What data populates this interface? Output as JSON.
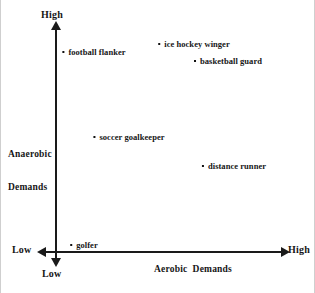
{
  "chart_data": {
    "type": "scatter",
    "title": "",
    "xlabel": "Aerobic  Demands",
    "ylabel": "Anaerobic\nDemands",
    "ylabel_line1": "Anaerobic",
    "ylabel_line2": "Demands",
    "grid": false,
    "legend": "none",
    "xlim": [
      0,
      100
    ],
    "ylim": [
      0,
      100
    ],
    "axis_ticks": {
      "x_low": "Low",
      "x_high": "High",
      "y_low": "Low",
      "y_high": "High"
    },
    "points": [
      {
        "label": "football flanker",
        "x": 17,
        "y": 87,
        "px": 93,
        "py": 52,
        "name": "point-football-flanker"
      },
      {
        "label": "ice hockey winger",
        "x": 60,
        "y": 91,
        "px": 193,
        "py": 44,
        "name": "point-ice-hockey-winger"
      },
      {
        "label": "basketball guard",
        "x": 75,
        "y": 84,
        "px": 227,
        "py": 61,
        "name": "point-basketball-guard"
      },
      {
        "label": "soccer goalkeeper",
        "x": 32,
        "y": 51,
        "px": 128,
        "py": 137,
        "name": "point-soccer-goalkeeper"
      },
      {
        "label": "distance runner",
        "x": 79,
        "y": 38,
        "px": 233,
        "py": 166,
        "name": "point-distance-runner"
      },
      {
        "label": "golfer",
        "x": 13,
        "y": 3,
        "px": 83,
        "py": 245,
        "name": "point-golfer"
      }
    ],
    "colors": {
      "axis": "#1a1a1a",
      "marker": "#111111",
      "text": "#161616",
      "background": "#ffffff"
    }
  }
}
